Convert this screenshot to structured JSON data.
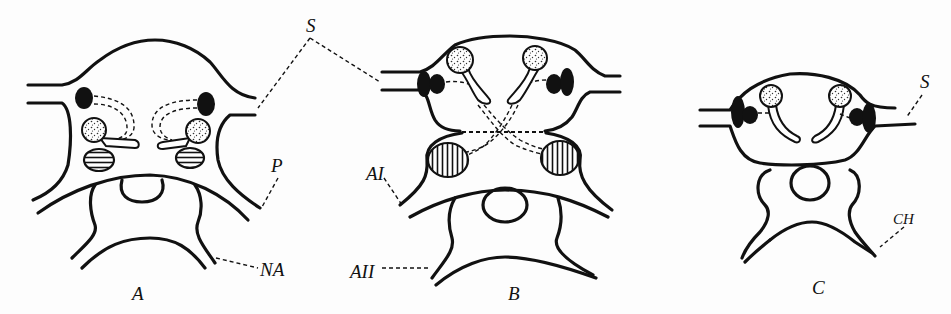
{
  "figure": {
    "panels": [
      {
        "id": "A",
        "label": "A"
      },
      {
        "id": "B",
        "label": "B"
      },
      {
        "id": "C",
        "label": "C"
      }
    ],
    "annotations": {
      "s_a_b": "S",
      "p": "P",
      "na": "NA",
      "a1": "AI",
      "a2": "AII",
      "s_c": "S",
      "ch": "CH"
    }
  }
}
